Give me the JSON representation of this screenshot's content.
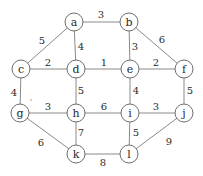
{
  "diagram": {
    "type": "weighted-undirected-graph",
    "nodes": [
      {
        "id": "a",
        "label": "a",
        "x": 74,
        "y": 22
      },
      {
        "id": "b",
        "label": "b",
        "x": 129,
        "y": 22
      },
      {
        "id": "c",
        "label": "c",
        "x": 21,
        "y": 69
      },
      {
        "id": "d",
        "label": "d",
        "x": 76,
        "y": 69
      },
      {
        "id": "e",
        "label": "e",
        "x": 130,
        "y": 69
      },
      {
        "id": "f",
        "label": "f",
        "x": 184,
        "y": 69
      },
      {
        "id": "g",
        "label": "g",
        "x": 20,
        "y": 113
      },
      {
        "id": "h",
        "label": "h",
        "x": 76,
        "y": 113
      },
      {
        "id": "i",
        "label": "i",
        "x": 130,
        "y": 113
      },
      {
        "id": "j",
        "label": "j",
        "x": 184,
        "y": 113
      },
      {
        "id": "k",
        "label": "k",
        "x": 76,
        "y": 154
      },
      {
        "id": "l",
        "label": "l",
        "x": 129,
        "y": 154
      }
    ],
    "edges": [
      {
        "from": "a",
        "to": "b",
        "weight": "3",
        "lx": 101,
        "ly": 14
      },
      {
        "from": "a",
        "to": "c",
        "weight": "5",
        "lx": 42,
        "ly": 40
      },
      {
        "from": "a",
        "to": "d",
        "weight": "4",
        "lx": 81,
        "ly": 46
      },
      {
        "from": "b",
        "to": "e",
        "weight": "3",
        "lx": 135,
        "ly": 46
      },
      {
        "from": "b",
        "to": "f",
        "weight": "6",
        "lx": 162,
        "ly": 39
      },
      {
        "from": "c",
        "to": "d",
        "weight": "2",
        "lx": 48,
        "ly": 62
      },
      {
        "from": "d",
        "to": "e",
        "weight": "1",
        "lx": 104,
        "ly": 62
      },
      {
        "from": "e",
        "to": "f",
        "weight": "2",
        "lx": 156,
        "ly": 62
      },
      {
        "from": "c",
        "to": "g",
        "weight": "4",
        "lx": 14,
        "ly": 92
      },
      {
        "from": "d",
        "to": "h",
        "weight": "5",
        "lx": 81,
        "ly": 90
      },
      {
        "from": "e",
        "to": "i",
        "weight": "4",
        "lx": 136,
        "ly": 90
      },
      {
        "from": "f",
        "to": "j",
        "weight": "5",
        "lx": 190,
        "ly": 90
      },
      {
        "from": "g",
        "to": "h",
        "weight": "3",
        "lx": 48,
        "ly": 106
      },
      {
        "from": "h",
        "to": "i",
        "weight": "6",
        "lx": 104,
        "ly": 106
      },
      {
        "from": "i",
        "to": "j",
        "weight": "3",
        "lx": 156,
        "ly": 106
      },
      {
        "from": "g",
        "to": "k",
        "weight": "6",
        "lx": 41,
        "ly": 142
      },
      {
        "from": "h",
        "to": "k",
        "weight": "7",
        "lx": 81,
        "ly": 132
      },
      {
        "from": "i",
        "to": "l",
        "weight": "5",
        "lx": 136,
        "ly": 132
      },
      {
        "from": "j",
        "to": "l",
        "weight": "9",
        "lx": 169,
        "ly": 141
      },
      {
        "from": "k",
        "to": "l",
        "weight": "8",
        "lx": 103,
        "ly": 162
      }
    ],
    "colors": {
      "edge": "#8a8a8a",
      "node_stroke": "#6e6e6e",
      "text": "#2a2a2a",
      "background": "#ffffff"
    }
  }
}
